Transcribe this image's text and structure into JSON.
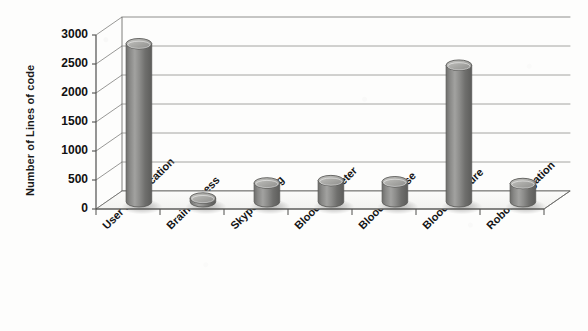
{
  "chart_data": {
    "type": "bar",
    "title": "",
    "subtitle": "",
    "xlabel": "",
    "ylabel": "Number of Lines of code",
    "categories": [
      "User identification",
      "Brain Fitness",
      "Skype calling",
      "Blood oxymeter",
      "Blood glucose",
      "Blood pressure",
      "Robot Navigation"
    ],
    "values": [
      2850,
      190,
      450,
      490,
      470,
      2480,
      440
    ],
    "ylim": [
      0,
      3000
    ],
    "yticks": [
      0,
      500,
      1000,
      1500,
      2000,
      2500,
      3000
    ],
    "ytick_labels": [
      "0",
      "500",
      "1000",
      "1500",
      "2000",
      "2500",
      "3000"
    ],
    "grid": true,
    "grid_axis": "y",
    "legend": false,
    "legend_position": "none",
    "style": "3d-cylinder",
    "bar_color": "#7a7a78",
    "bar_color_light": "#a9a9a6",
    "bar_color_dark": "#5c5c5a",
    "axis_color": "#5a5a58",
    "grid_color": "#8e8e8c",
    "text_color": "#141414",
    "background": "#fdfdfc"
  }
}
